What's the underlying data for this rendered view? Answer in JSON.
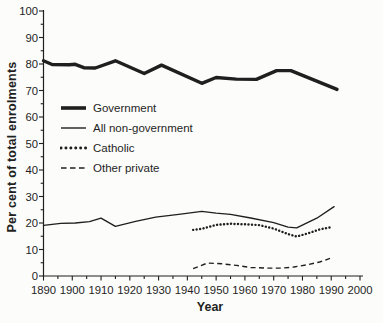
{
  "figure": {
    "background": "#fcfcfa",
    "ink_color": "#1f1f1f"
  },
  "chart_data": {
    "type": "line",
    "title": "",
    "xlabel": "Year",
    "ylabel": "Per cent of total enrolments",
    "xlim": [
      1890,
      2000
    ],
    "ylim": [
      0,
      100
    ],
    "x_major_ticks": [
      1890,
      1900,
      1910,
      1920,
      1930,
      1940,
      1950,
      1960,
      1970,
      1980,
      1990,
      2000
    ],
    "x_minor_step": 5,
    "y_major_ticks": [
      0,
      10,
      20,
      30,
      40,
      50,
      60,
      70,
      80,
      90,
      100
    ],
    "y_minor_step": 5,
    "grid": false,
    "legend_position": "inside upper-left",
    "series": [
      {
        "name": "Government",
        "style": "solid-thick",
        "points": [
          [
            1890,
            81.2
          ],
          [
            1893,
            79.8
          ],
          [
            1899,
            79.7
          ],
          [
            1901,
            79.9
          ],
          [
            1904,
            78.6
          ],
          [
            1908,
            78.5
          ],
          [
            1915,
            81.2
          ],
          [
            1925,
            76.4
          ],
          [
            1931,
            79.6
          ],
          [
            1945,
            72.7
          ],
          [
            1950,
            74.9
          ],
          [
            1957,
            74.3
          ],
          [
            1964,
            74.2
          ],
          [
            1971,
            77.5
          ],
          [
            1976,
            77.5
          ],
          [
            1992,
            70.4
          ]
        ]
      },
      {
        "name": "All non-government",
        "style": "solid-thin",
        "points": [
          [
            1890,
            19.1
          ],
          [
            1896,
            19.9
          ],
          [
            1901,
            20.0
          ],
          [
            1906,
            20.5
          ],
          [
            1910,
            21.8
          ],
          [
            1915,
            18.7
          ],
          [
            1922,
            20.6
          ],
          [
            1929,
            22.2
          ],
          [
            1937,
            23.3
          ],
          [
            1945,
            24.4
          ],
          [
            1950,
            23.7
          ],
          [
            1955,
            23.3
          ],
          [
            1962,
            21.9
          ],
          [
            1970,
            20.1
          ],
          [
            1975,
            18.4
          ],
          [
            1978,
            18.2
          ],
          [
            1985,
            21.8
          ],
          [
            1991,
            26.2
          ]
        ]
      },
      {
        "name": "Catholic",
        "style": "dotted",
        "points": [
          [
            1942,
            17.4
          ],
          [
            1945,
            17.8
          ],
          [
            1950,
            19.3
          ],
          [
            1955,
            19.7
          ],
          [
            1960,
            19.5
          ],
          [
            1965,
            19.2
          ],
          [
            1970,
            17.9
          ],
          [
            1975,
            15.8
          ],
          [
            1978,
            14.9
          ],
          [
            1982,
            16.1
          ],
          [
            1986,
            17.6
          ],
          [
            1990,
            18.4
          ]
        ]
      },
      {
        "name": "Other private",
        "style": "dashed",
        "points": [
          [
            1942,
            2.8
          ],
          [
            1947,
            4.9
          ],
          [
            1952,
            4.6
          ],
          [
            1957,
            4.0
          ],
          [
            1962,
            3.2
          ],
          [
            1968,
            3.0
          ],
          [
            1973,
            3.0
          ],
          [
            1977,
            3.4
          ],
          [
            1982,
            4.3
          ],
          [
            1986,
            5.3
          ],
          [
            1990,
            6.8
          ]
        ]
      }
    ]
  }
}
